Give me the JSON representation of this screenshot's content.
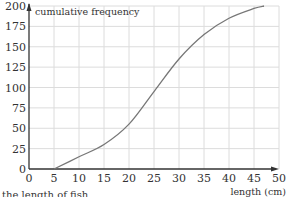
{
  "chart_data": {
    "type": "line",
    "title": "",
    "xlabel": "length (cm)",
    "ylabel": "cumulative frequency",
    "xlim": [
      0,
      50
    ],
    "ylim": [
      0,
      200
    ],
    "x_ticks": [
      0,
      5,
      10,
      15,
      20,
      25,
      30,
      35,
      40,
      45,
      50
    ],
    "y_ticks": [
      0,
      25,
      50,
      75,
      100,
      125,
      150,
      175,
      200
    ],
    "grid": true,
    "legend": null,
    "series": [
      {
        "name": "cumulative frequency",
        "x": [
          5,
          10,
          15,
          20,
          25,
          30,
          35,
          40,
          45,
          47
        ],
        "values": [
          0,
          15,
          30,
          55,
          95,
          135,
          165,
          185,
          197,
          200
        ]
      }
    ]
  },
  "caption": "the length of fish"
}
